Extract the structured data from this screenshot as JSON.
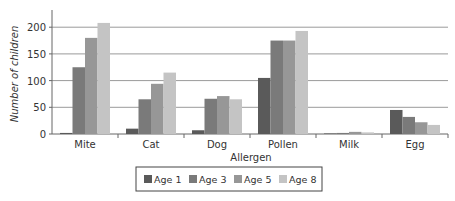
{
  "chart_data": {
    "type": "bar",
    "title": "",
    "xlabel": "Allergen",
    "ylabel": "Number of children",
    "ylim": [
      0,
      230
    ],
    "yticks": [
      0,
      50,
      100,
      150,
      200
    ],
    "grid": true,
    "legend_position": "bottom",
    "categories": [
      "Mite",
      "Cat",
      "Dog",
      "Pollen",
      "Milk",
      "Egg"
    ],
    "series": [
      {
        "name": "Age 1",
        "color": "#5a5a5a",
        "values": [
          2,
          10,
          7,
          105,
          1,
          45
        ]
      },
      {
        "name": "Age 3",
        "color": "#7a7a7a",
        "values": [
          125,
          65,
          66,
          175,
          2,
          32
        ]
      },
      {
        "name": "Age 5",
        "color": "#979797",
        "values": [
          180,
          94,
          71,
          175,
          4,
          22
        ]
      },
      {
        "name": "Age 8",
        "color": "#c4c4c4",
        "values": [
          208,
          115,
          65,
          193,
          3,
          17
        ]
      }
    ]
  }
}
